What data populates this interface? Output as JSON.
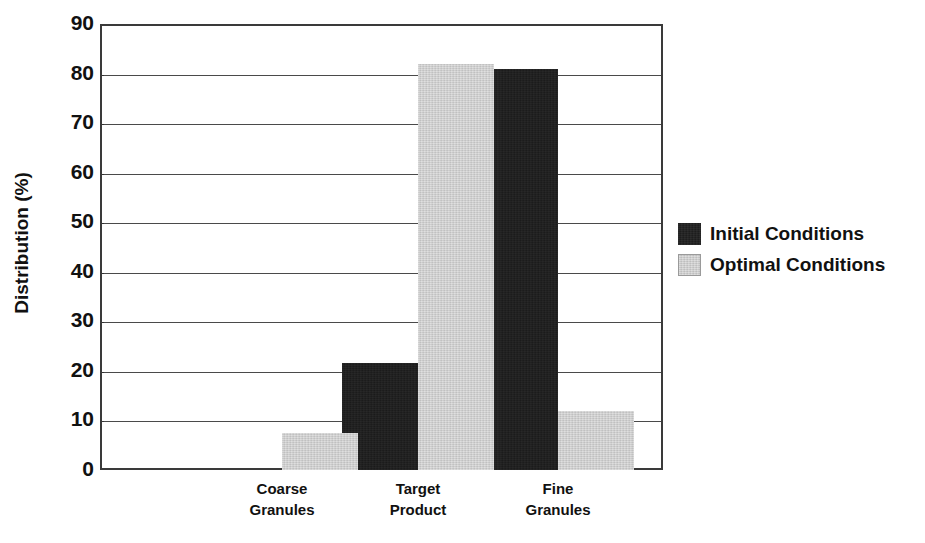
{
  "chart_data": {
    "type": "bar",
    "title": "",
    "subtitle": "",
    "xlabel": "",
    "ylabel": "Distribution (%)",
    "categories": [
      "Coarse Granules",
      "Target Product",
      "Fine Granules"
    ],
    "category_lines": [
      [
        "Coarse",
        "Granules"
      ],
      [
        "Target",
        "Product"
      ],
      [
        "Fine",
        "Granules"
      ]
    ],
    "series": [
      {
        "name": "Initial Conditions",
        "color": "#171717",
        "values": [
          0,
          21.5,
          81
        ]
      },
      {
        "name": "Optimal Conditions",
        "color": "#c9c9c9",
        "values": [
          7.5,
          82,
          12
        ]
      }
    ],
    "ylim": [
      0,
      90
    ],
    "ytick_step": 10,
    "yticks": [
      90,
      80,
      70,
      60,
      50,
      40,
      30,
      20,
      10,
      0
    ],
    "ytick_labels": [
      "90",
      "80",
      "70",
      "60",
      "50",
      "40",
      "30",
      "20",
      "10",
      "0"
    ],
    "grid": true,
    "grid_axis": "y",
    "legend_position": "right",
    "bar_gap": 0,
    "frame": true
  },
  "axis": {
    "y_title": "Distribution (%)"
  },
  "legend": {
    "entries": [
      {
        "label": "Initial Conditions",
        "swatch": "legend-swatch-dark"
      },
      {
        "label": "Optimal Conditions",
        "swatch": "legend-swatch-light"
      }
    ]
  }
}
